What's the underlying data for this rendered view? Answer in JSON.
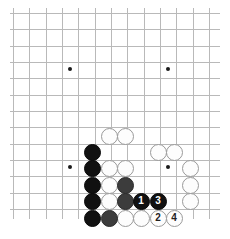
{
  "board": {
    "title": "Go board position diagram",
    "game": "go",
    "colors": {
      "background": "#ffffff",
      "grid_line": "#b9b9b9",
      "board_edge": "#4a4a4a",
      "black_stone": "#111111",
      "gray_stone": "#3c3c3c",
      "white_stone": "#fdfdfd",
      "white_stone_outline": "#9a9a9a",
      "star_point": "#1a1a1a"
    },
    "geometry": {
      "origin_x": 13,
      "origin_y": 13,
      "spacing": 16.33,
      "columns": 13,
      "rows": 13,
      "stone_diameter": 17,
      "right_edge_x": 218,
      "bottom_edge_y": 218,
      "cropped_sides": [
        "left",
        "top"
      ]
    },
    "star_points": [
      {
        "x": 70,
        "y": 69
      },
      {
        "x": 168,
        "y": 69
      },
      {
        "x": 70,
        "y": 167
      },
      {
        "x": 168,
        "y": 167
      }
    ],
    "stones": [
      {
        "color": "white",
        "x": 109,
        "y": 136,
        "label": ""
      },
      {
        "color": "white",
        "x": 125,
        "y": 136,
        "label": ""
      },
      {
        "color": "black",
        "x": 92,
        "y": 152,
        "label": ""
      },
      {
        "color": "white",
        "x": 158,
        "y": 152,
        "label": ""
      },
      {
        "color": "white",
        "x": 174,
        "y": 152,
        "label": ""
      },
      {
        "color": "black",
        "x": 92,
        "y": 168,
        "label": ""
      },
      {
        "color": "white",
        "x": 109,
        "y": 168,
        "label": ""
      },
      {
        "color": "white",
        "x": 125,
        "y": 168,
        "label": ""
      },
      {
        "color": "white",
        "x": 190,
        "y": 168,
        "label": ""
      },
      {
        "color": "black",
        "x": 92,
        "y": 185,
        "label": ""
      },
      {
        "color": "white",
        "x": 109,
        "y": 185,
        "label": ""
      },
      {
        "color": "gray",
        "x": 125,
        "y": 185,
        "label": ""
      },
      {
        "color": "white",
        "x": 190,
        "y": 185,
        "label": ""
      },
      {
        "color": "black",
        "x": 92,
        "y": 201,
        "label": ""
      },
      {
        "color": "white",
        "x": 109,
        "y": 201,
        "label": ""
      },
      {
        "color": "gray",
        "x": 125,
        "y": 201,
        "label": ""
      },
      {
        "color": "black",
        "x": 141,
        "y": 201,
        "label": "1"
      },
      {
        "color": "black",
        "x": 158,
        "y": 201,
        "label": "3"
      },
      {
        "color": "white",
        "x": 190,
        "y": 201,
        "label": ""
      },
      {
        "color": "black",
        "x": 92,
        "y": 218,
        "label": ""
      },
      {
        "color": "gray",
        "x": 109,
        "y": 218,
        "label": ""
      },
      {
        "color": "white",
        "x": 125,
        "y": 218,
        "label": ""
      },
      {
        "color": "white",
        "x": 141,
        "y": 218,
        "label": ""
      },
      {
        "color": "white",
        "x": 158,
        "y": 218,
        "label": "2"
      },
      {
        "color": "white",
        "x": 174,
        "y": 218,
        "label": "4"
      }
    ],
    "move_sequence": [
      {
        "number": "1",
        "color": "black"
      },
      {
        "number": "2",
        "color": "white"
      },
      {
        "number": "3",
        "color": "black"
      },
      {
        "number": "4",
        "color": "white"
      }
    ]
  }
}
